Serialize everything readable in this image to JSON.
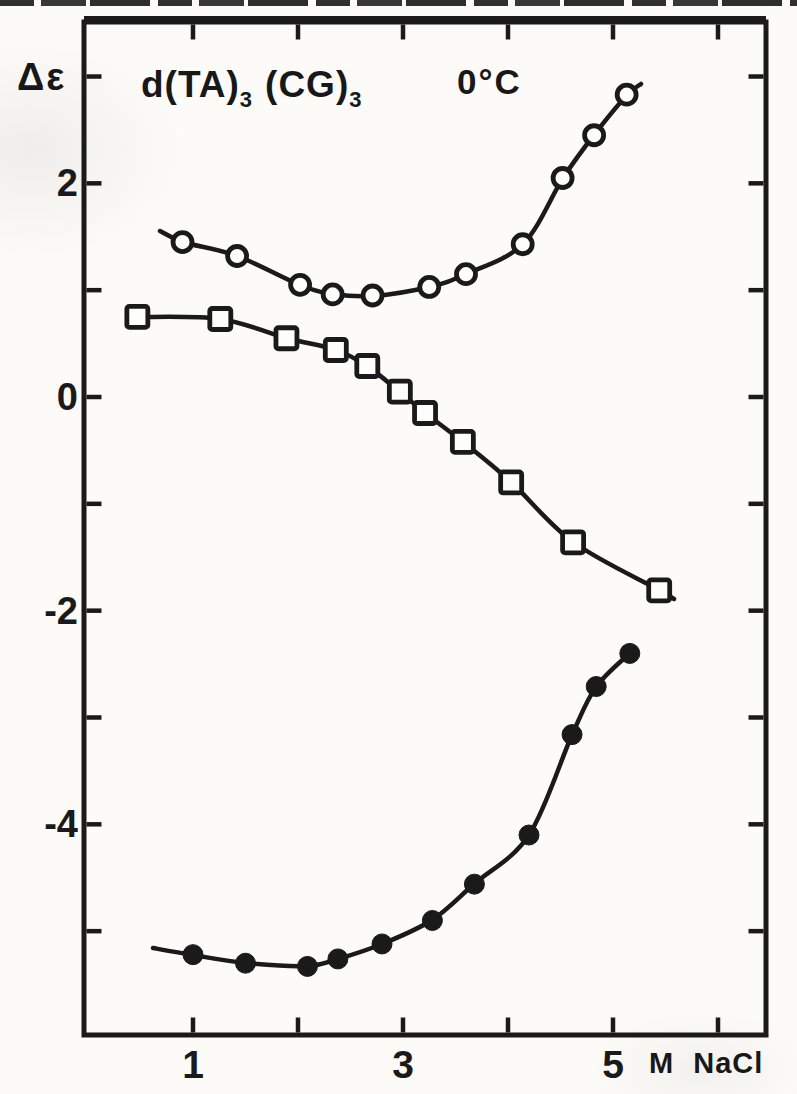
{
  "page": {
    "ink_color": "#1a1a1a",
    "paper_color": "#fcfbf8"
  },
  "chart_data": {
    "type": "line",
    "title": "d(TA)3 (CG)3",
    "title_parts": [
      {
        "text": "d(TA)",
        "sub": false,
        "gap": false
      },
      {
        "text": "3",
        "sub": true,
        "gap": false
      },
      {
        "text": "(CG)",
        "sub": false,
        "gap": true
      },
      {
        "text": "3",
        "sub": true,
        "gap": false
      }
    ],
    "annotation": "0°C",
    "ylabel": "Δε",
    "xlabel": "M NaCl",
    "xlim": [
      0,
      6.5
    ],
    "ylim": [
      -5.97,
      3.51
    ],
    "grid": false,
    "frame": true,
    "legend": "none",
    "xticks": [
      {
        "v": 1,
        "label": "1"
      },
      {
        "v": 2,
        "label": ""
      },
      {
        "v": 3,
        "label": "3"
      },
      {
        "v": 4,
        "label": ""
      },
      {
        "v": 5,
        "label": "5"
      },
      {
        "v": 6,
        "label": ""
      }
    ],
    "yticks": [
      {
        "v": 3,
        "label": ""
      },
      {
        "v": 2,
        "label": "2"
      },
      {
        "v": 1,
        "label": ""
      },
      {
        "v": 0,
        "label": "0"
      },
      {
        "v": -1,
        "label": ""
      },
      {
        "v": -2,
        "label": "-2"
      },
      {
        "v": -3,
        "label": ""
      },
      {
        "v": -4,
        "label": "-4"
      },
      {
        "v": -5,
        "label": ""
      }
    ],
    "series": [
      {
        "name": "open-circles",
        "marker": "circle-open",
        "x": [
          0.9,
          1.42,
          2.02,
          2.33,
          2.71,
          3.25,
          3.6,
          4.14,
          4.52,
          4.82,
          5.13
        ],
        "y": [
          1.45,
          1.32,
          1.05,
          0.96,
          0.95,
          1.03,
          1.15,
          1.43,
          2.05,
          2.45,
          2.83
        ],
        "ext_before": [
          0.69,
          1.55
        ],
        "ext_after": [
          5.27,
          2.93
        ]
      },
      {
        "name": "open-squares",
        "marker": "square-open",
        "x": [
          0.47,
          1.26,
          1.89,
          2.36,
          2.66,
          2.97,
          3.21,
          3.57,
          4.03,
          4.62,
          5.44
        ],
        "y": [
          0.75,
          0.73,
          0.55,
          0.44,
          0.29,
          0.05,
          -0.15,
          -0.42,
          -0.8,
          -1.36,
          -1.81
        ],
        "ext_before": null,
        "ext_after": [
          5.58,
          -1.89
        ]
      },
      {
        "name": "filled-circles",
        "marker": "circle-filled",
        "x": [
          1.0,
          1.5,
          2.09,
          2.38,
          2.8,
          3.28,
          3.68,
          4.2,
          4.61,
          4.84,
          5.16
        ],
        "y": [
          -5.22,
          -5.3,
          -5.33,
          -5.26,
          -5.12,
          -4.9,
          -4.56,
          -4.1,
          -3.16,
          -2.71,
          -2.4
        ],
        "ext_before": [
          0.62,
          -5.16
        ],
        "ext_after": null
      }
    ]
  }
}
